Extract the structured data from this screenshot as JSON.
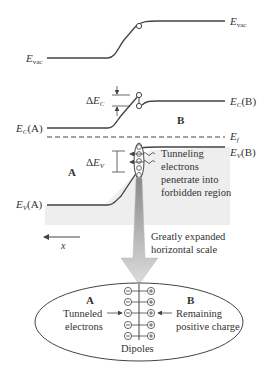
{
  "diagram": {
    "colors": {
      "line": "#444444",
      "shading": "#efefef",
      "arrow_gradient_top": "#888888",
      "arrow_gradient_bottom": "#d8d8d8",
      "text": "#333333"
    },
    "labels": {
      "evac_left": {
        "main": "E",
        "sub": "vac"
      },
      "evac_right": {
        "main": "E",
        "sub": "vac"
      },
      "ec_a": {
        "main": "E",
        "sub": "C",
        "suffix": "(A)"
      },
      "ec_b": {
        "main": "E",
        "sub": "C",
        "suffix": "(B)"
      },
      "ef": {
        "main": "E",
        "sub": "f"
      },
      "ev_a": {
        "main": "E",
        "sub": "V",
        "suffix": "(A)"
      },
      "ev_b": {
        "main": "E",
        "sub": "V",
        "suffix": "(B)"
      },
      "delta_ec": {
        "prefix": "Δ",
        "main": "E",
        "sub": "C"
      },
      "delta_ev": {
        "prefix": "Δ",
        "main": "E",
        "sub": "V"
      },
      "region_a": "A",
      "region_b": "B",
      "tunneling_note": [
        "Tunneling",
        "electrons",
        "penetrate into",
        "forbidden region"
      ],
      "scale_note": [
        "Greatly expanded",
        "horizontal scale"
      ],
      "x_axis": "x"
    },
    "inset": {
      "region_a": "A",
      "region_b": "B",
      "left_note": [
        "Tunneled",
        "electrons"
      ],
      "right_note": [
        "Remaining",
        "positive charge"
      ],
      "caption": "Dipoles",
      "dipole_rows": 5,
      "negative_symbol": "−",
      "positive_symbol": "+"
    }
  }
}
